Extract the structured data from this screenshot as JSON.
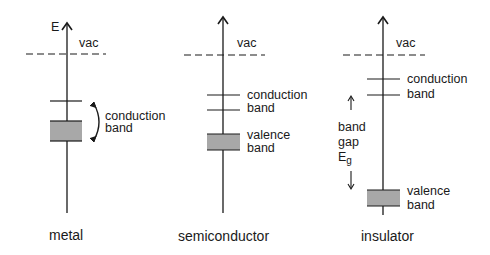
{
  "diagram": {
    "axis_label": "E",
    "colors": {
      "line": "#1a1a1a",
      "band_fill": "#a8a8a8"
    },
    "panels": [
      {
        "title": "metal",
        "vacuum_label": "vac",
        "conduction_label": [
          "conduction",
          "band"
        ]
      },
      {
        "title": "semiconductor",
        "vacuum_label": "vac",
        "conduction_label": [
          "conduction",
          "band"
        ],
        "valence_label": [
          "valence",
          "band"
        ]
      },
      {
        "title": "insulator",
        "vacuum_label": "vac",
        "conduction_label": [
          "conduction",
          "band"
        ],
        "valence_label": [
          "valence",
          "band"
        ],
        "gap_label": [
          "band",
          "gap",
          "E",
          "g"
        ]
      }
    ]
  }
}
